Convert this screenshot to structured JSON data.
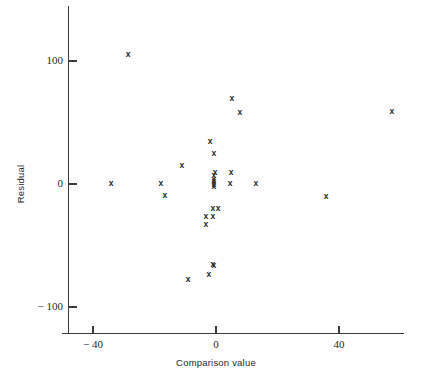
{
  "chart_data": {
    "type": "scatter",
    "title": "",
    "xlabel": "Comparison value",
    "ylabel": "Residual",
    "xlim": [
      -48,
      64
    ],
    "ylim": [
      -118,
      132
    ],
    "grid": false,
    "legend": null,
    "marker": "x",
    "marker_color": "#262626",
    "xticks": [
      -40,
      0,
      40
    ],
    "xtick_labels": [
      "− 40",
      "0",
      "40"
    ],
    "yticks": [
      100,
      0,
      -100
    ],
    "ytick_labels": [
      "100",
      "0",
      "− 100"
    ],
    "points": [
      {
        "x": -28.6,
        "y": 105
      },
      {
        "x": -34.1,
        "y": 0
      },
      {
        "x": -17.9,
        "y": 0
      },
      {
        "x": -16.6,
        "y": -9.8
      },
      {
        "x": -11.1,
        "y": 14.6
      },
      {
        "x": -1.9,
        "y": 34.1
      },
      {
        "x": -0.7,
        "y": 24.4
      },
      {
        "x": 5.2,
        "y": 69.1
      },
      {
        "x": 7.8,
        "y": 57.7
      },
      {
        "x": 57.2,
        "y": 58.5
      },
      {
        "x": -0.7,
        "y": 6.5
      },
      {
        "x": -0.7,
        "y": 3.3
      },
      {
        "x": -0.7,
        "y": 1.6
      },
      {
        "x": -0.7,
        "y": -0.8
      },
      {
        "x": -0.7,
        "y": -2.4
      },
      {
        "x": -0.3,
        "y": 8.9
      },
      {
        "x": 4.9,
        "y": 8.9
      },
      {
        "x": 4.6,
        "y": 0
      },
      {
        "x": 13.0,
        "y": 0
      },
      {
        "x": 35.8,
        "y": -10.6
      },
      {
        "x": -1.0,
        "y": -20.3
      },
      {
        "x": 0.7,
        "y": -20.3
      },
      {
        "x": -3.3,
        "y": -26.8
      },
      {
        "x": -1.0,
        "y": -26.8
      },
      {
        "x": -3.3,
        "y": -33.3
      },
      {
        "x": -1.0,
        "y": -65.9
      },
      {
        "x": -0.7,
        "y": -66.7
      },
      {
        "x": -2.3,
        "y": -74.0
      },
      {
        "x": -9.1,
        "y": -78.0
      }
    ]
  },
  "axis": {
    "x_title": "Comparison value",
    "y_title": "Residual"
  }
}
